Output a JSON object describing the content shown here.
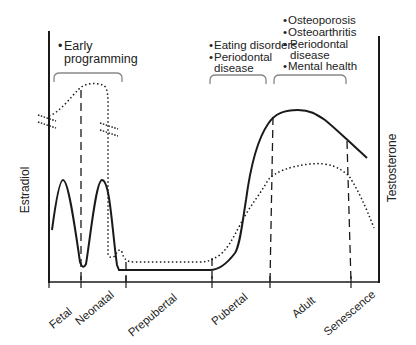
{
  "axes": {
    "left_label": "Estradiol",
    "right_label": "Testosterone"
  },
  "stages": [
    {
      "label": "Fetal"
    },
    {
      "label": "Neonatal"
    },
    {
      "label": "Prepubertal"
    },
    {
      "label": "Pubertal"
    },
    {
      "label": "Adult"
    },
    {
      "label": "Senescence"
    }
  ],
  "annotations": {
    "early": {
      "bullet": "•",
      "lines": [
        "Early",
        "programming"
      ]
    },
    "pubertal": {
      "items": [
        {
          "bullet": "•",
          "lines": [
            "Eating disorders"
          ]
        },
        {
          "bullet": "•",
          "lines": [
            "Periodontal",
            "disease"
          ]
        }
      ]
    },
    "adult": {
      "items": [
        {
          "bullet": "•",
          "lines": [
            "Osteoporosis"
          ]
        },
        {
          "bullet": "•",
          "lines": [
            "Osteoarthritis"
          ]
        },
        {
          "bullet": "•",
          "lines": [
            "Periodontal",
            "disease"
          ]
        },
        {
          "bullet": "•",
          "lines": [
            "Mental health"
          ]
        }
      ]
    }
  },
  "legend_styles": {
    "estradiol_curve": "dotted",
    "testosterone_curve": "solid"
  },
  "colors": {
    "line": "#1a1a1a",
    "text": "#222222",
    "bracket": "#888888"
  }
}
